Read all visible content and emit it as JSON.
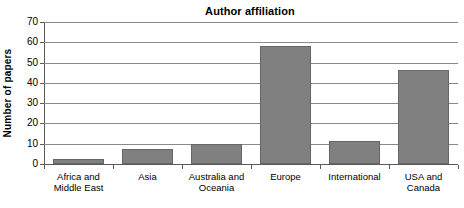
{
  "chart_data": {
    "type": "bar",
    "title": "Author affiliation",
    "xlabel": "",
    "ylabel": "Number of papers",
    "categories": [
      "Africa and Middle East",
      "Asia",
      "Australia and Oceania",
      "Europe",
      "International",
      "USA and Canada"
    ],
    "values": [
      2.5,
      7.5,
      10,
      58,
      11.5,
      46.5
    ],
    "ylim": [
      0,
      70
    ],
    "ytick_values": [
      0,
      10,
      20,
      30,
      40,
      50,
      60,
      70
    ],
    "ytick_labels": [
      "0",
      "10",
      "20",
      "30",
      "40",
      "50",
      "60",
      "70"
    ],
    "grid": true,
    "legend": false,
    "bar_color": "#808080",
    "bar_border_color": "#666666",
    "axis_color": "#5a5a5a",
    "gridline_color": "#8a8a8a",
    "background_color": "#ffffff"
  },
  "category_label_lines": [
    [
      "Africa and",
      "Middle East"
    ],
    [
      "Asia"
    ],
    [
      "Australia and",
      "Oceania"
    ],
    [
      "Europe"
    ],
    [
      "International"
    ],
    [
      "USA and Canada"
    ]
  ]
}
